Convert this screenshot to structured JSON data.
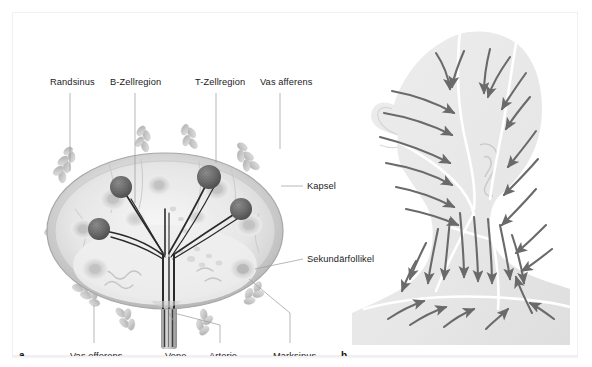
{
  "figure": {
    "panels": [
      {
        "id": "a",
        "marker": "a",
        "caption": "Lymphknoten im Querschnitt"
      },
      {
        "id": "b",
        "marker": "b",
        "caption": "Lymphabfluss Kopf und Hals"
      }
    ]
  },
  "panel_a": {
    "marker": "a",
    "labels": {
      "top": [
        {
          "text": "Randsinus",
          "x": 37,
          "y": 72,
          "leader_x": 57,
          "leader_y1": 80,
          "leader_y2": 158
        },
        {
          "text": "B-Zellregion",
          "x": 97,
          "y": 72,
          "leader_x": 122,
          "leader_y1": 80,
          "leader_y2": 186
        },
        {
          "text": "T-Zellregion",
          "x": 182,
          "y": 72,
          "leader_x": 203,
          "leader_y1": 80,
          "leader_y2": 147
        },
        {
          "text": "Vas afferens",
          "x": 247,
          "y": 72,
          "leader_x": 267,
          "leader_y1": 80,
          "leader_y2": 133
        }
      ],
      "right": [
        {
          "text": "Kapsel",
          "x": 294,
          "y": 176,
          "leader_x1": 270,
          "leader_x2": 290,
          "leader_y": 173
        },
        {
          "text": "Sekundärfollikel",
          "x": 294,
          "y": 249,
          "leader_x1": 268,
          "leader_x2": 290,
          "leader_y": 246
        }
      ],
      "bottom": [
        {
          "text": "Vas efferens",
          "x": 57,
          "y": 345,
          "leader_x": 81,
          "leader_y1": 330,
          "leader_y2": 290
        },
        {
          "text": "Vene",
          "x": 152,
          "y": 345,
          "leader_x": 163,
          "leader_y1": 330,
          "leader_y2": 300
        },
        {
          "text": "Arterie",
          "x": 196,
          "y": 345,
          "leader_x": 207,
          "leader_y1": 330,
          "leader_y2": 300
        },
        {
          "text": "Marksinus",
          "x": 260,
          "y": 345,
          "leader_x": 277,
          "leader_y1": 330,
          "leader_y2": 272
        }
      ]
    },
    "structure": {
      "capsule_color": "#b9b9b9",
      "cortex_color": "#dcdcdc",
      "medulla_color": "#ececec",
      "follicle_color": "#cfcfcf",
      "germinal_center_color": "#6f6f6f",
      "vessel_color": "#2e2e2e",
      "afferent_vessel_color": "#cccccc",
      "follicle_count": 9,
      "germinal_center_count": 4,
      "afferent_vessel_count": 9
    }
  },
  "panel_b": {
    "marker": "b",
    "structure": {
      "body_fill": "#e9e9e9",
      "territory_line_color": "#ffffff",
      "arrow_color": "#6a6a6a",
      "arrow_count": 34,
      "regions": [
        "Kopfhaut",
        "Gesicht",
        "Hals",
        "Supraklavikulargrube"
      ]
    }
  },
  "colors": {
    "background": "#ffffff",
    "frame_border": "#f0f0f0",
    "text": "#1b1b1b",
    "leader_line": "#9a9a9a"
  }
}
